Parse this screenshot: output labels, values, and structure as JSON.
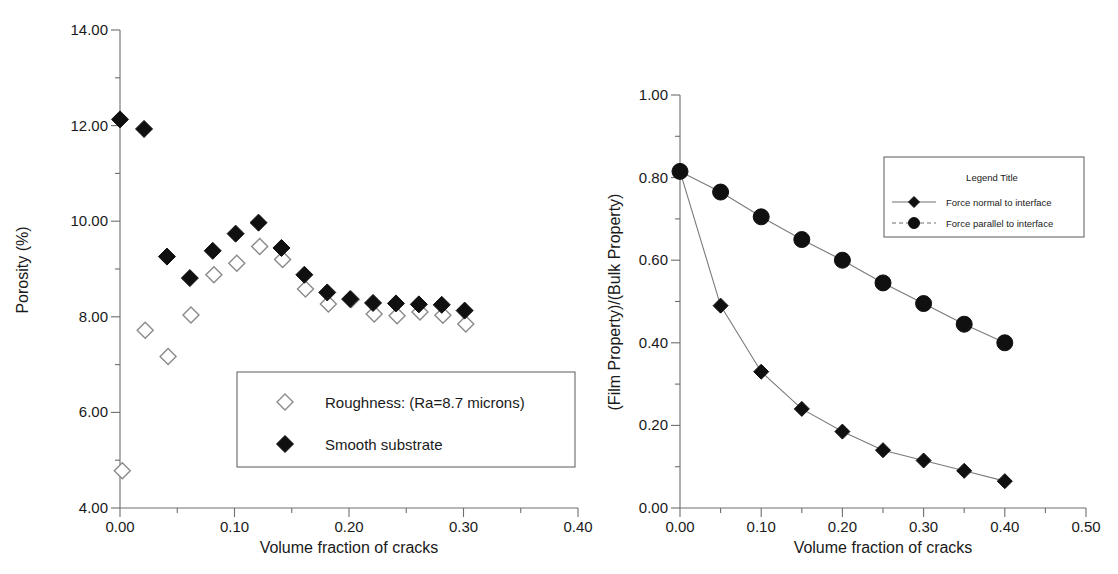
{
  "figure": {
    "background_color": "#ffffff",
    "filled_marker_color": "#101010",
    "open_marker_color": "#ffffff",
    "open_marker_stroke": "#8a8a8a",
    "axis_color": "#6e6e6e"
  },
  "chart_data": [
    {
      "id": "porosity-chart",
      "type": "scatter",
      "title": "",
      "xlabel": "Volume fraction of cracks",
      "ylabel": "Porosity (%)",
      "xlim": [
        0.0,
        0.4
      ],
      "ylim": [
        4.0,
        14.0
      ],
      "xticks": [
        0.0,
        0.1,
        0.2,
        0.3,
        0.4
      ],
      "xtick_labels": [
        "0.00",
        "0.10",
        "0.20",
        "0.30",
        "0.40"
      ],
      "xminor_step": 0.05,
      "yticks": [
        4.0,
        6.0,
        8.0,
        10.0,
        12.0,
        14.0
      ],
      "ytick_labels": [
        "4.00",
        "6.00",
        "8.00",
        "10.00",
        "12.00",
        "14.00"
      ],
      "yminor_step": 1.0,
      "grid": false,
      "legend_position": "inside-lower-center",
      "legend_title": "",
      "series": [
        {
          "name": "Roughness: (Ra=8.7 microns)",
          "marker": "open-diamond",
          "x": [
            0.002,
            0.022,
            0.042,
            0.062,
            0.082,
            0.102,
            0.122,
            0.142,
            0.162,
            0.182,
            0.202,
            0.222,
            0.242,
            0.262,
            0.282,
            0.302
          ],
          "y": [
            4.78,
            7.72,
            7.17,
            8.04,
            8.88,
            9.12,
            9.47,
            9.2,
            8.58,
            8.27,
            8.36,
            8.06,
            8.02,
            8.1,
            8.03,
            7.85
          ]
        },
        {
          "name": "Smooth substrate",
          "marker": "filled-diamond",
          "x": [
            0.0,
            0.021,
            0.041,
            0.061,
            0.081,
            0.101,
            0.121,
            0.141,
            0.161,
            0.181,
            0.201,
            0.221,
            0.241,
            0.261,
            0.281,
            0.301
          ],
          "y": [
            12.13,
            11.93,
            9.26,
            8.81,
            9.38,
            9.74,
            9.97,
            9.44,
            8.88,
            8.51,
            8.37,
            8.29,
            8.28,
            8.26,
            8.25,
            8.13
          ]
        }
      ]
    },
    {
      "id": "film-property-chart",
      "type": "line",
      "title": "",
      "xlabel": "Volume fraction of cracks",
      "ylabel": "(Film Property)/(Bulk Property)",
      "xlim": [
        0.0,
        0.5
      ],
      "ylim": [
        0.0,
        1.0
      ],
      "xticks": [
        0.0,
        0.1,
        0.2,
        0.3,
        0.4,
        0.5
      ],
      "xtick_labels": [
        "0.00",
        "0.10",
        "0.20",
        "0.30",
        "0.40",
        "0.50"
      ],
      "xminor_step": 0.05,
      "yticks": [
        0.0,
        0.2,
        0.4,
        0.6,
        0.8,
        1.0
      ],
      "ytick_labels": [
        "0.00",
        "0.20",
        "0.40",
        "0.60",
        "0.80",
        "1.00"
      ],
      "yminor_step": 0.1,
      "grid": false,
      "legend_position": "inside-upper-right",
      "legend_title": "Legend Title",
      "x": [
        0.0,
        0.05,
        0.1,
        0.15,
        0.2,
        0.25,
        0.3,
        0.35,
        0.4
      ],
      "series": [
        {
          "name": "Force normal to interface",
          "marker": "filled-diamond",
          "linestyle": "solid",
          "values": [
            0.815,
            0.49,
            0.33,
            0.24,
            0.185,
            0.14,
            0.115,
            0.09,
            0.065
          ]
        },
        {
          "name": "Force parallel to interface",
          "marker": "filled-circle",
          "linestyle": "dashed",
          "values": [
            0.815,
            0.765,
            0.705,
            0.65,
            0.6,
            0.545,
            0.495,
            0.445,
            0.4
          ]
        }
      ]
    }
  ]
}
